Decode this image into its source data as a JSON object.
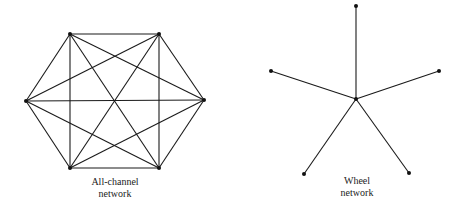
{
  "colors": {
    "line": "#1a1a1a",
    "node": "#111111",
    "text": "#222222",
    "background": "#ffffff"
  },
  "diagrams": [
    {
      "id": "all-channel",
      "label_lines": [
        "All-channel",
        "network"
      ],
      "label_pos": [
        115,
        185
      ],
      "nodes": [
        [
          70,
          34
        ],
        [
          159,
          34
        ],
        [
          204,
          100
        ],
        [
          159,
          168
        ],
        [
          70,
          168
        ],
        [
          26,
          101
        ]
      ],
      "edges": "complete"
    },
    {
      "id": "wheel",
      "label_lines": [
        "Wheel",
        "network"
      ],
      "label_pos": [
        357,
        184
      ],
      "hub": [
        356,
        99
      ],
      "nodes": [
        [
          356,
          6
        ],
        [
          439,
          71
        ],
        [
          409,
          173
        ],
        [
          304,
          174
        ],
        [
          271,
          71
        ]
      ],
      "edges": "star"
    }
  ]
}
